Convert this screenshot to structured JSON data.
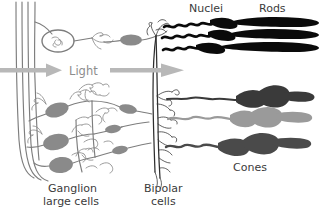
{
  "figure": {
    "title_alt": "Retina cell diagram: light path through ganglion, bipolar cells to rods and cones",
    "background_color": "#ffffff"
  },
  "labels": {
    "nuclei": "Nuclei",
    "rods": "Rods",
    "light": "Light",
    "cones": "Cones",
    "ganglion_line1": "Ganglion",
    "ganglion_line2": "large cells",
    "bipolar_line1": "Bipolar",
    "bipolar_line2": "cells"
  },
  "colors": {
    "label_text": "#3b3b3b",
    "light_text": "#8d8d8d",
    "light_arrow": "#b8b8b8",
    "ganglion_cell": "#8a8a8a",
    "ganglion_outline": "#7d7d7d",
    "bipolar_cell": "#2e2e2e",
    "rod": "#0a0a0a",
    "cone_dark": "#3a3a3a",
    "cone_light": "#9a9a9a",
    "cone_medium": "#4a4a4a"
  },
  "structures": {
    "rods": [
      {
        "name": "rod-1",
        "color": "#0a0a0a"
      },
      {
        "name": "rod-2",
        "color": "#0a0a0a"
      },
      {
        "name": "rod-3",
        "color": "#0a0a0a"
      }
    ],
    "cones": [
      {
        "name": "cone-1",
        "color": "#3a3a3a"
      },
      {
        "name": "cone-2",
        "color": "#9a9a9a"
      },
      {
        "name": "cone-3",
        "color": "#4a4a4a"
      }
    ],
    "ganglion_cells": [
      {
        "name": "ganglion-circled",
        "color": "#8a8a8a"
      },
      {
        "name": "ganglion-1",
        "color": "#8a8a8a"
      },
      {
        "name": "ganglion-2",
        "color": "#8a8a8a"
      },
      {
        "name": "ganglion-3",
        "color": "#8a8a8a"
      }
    ],
    "light_arrows": [
      {
        "name": "light-arrow-left"
      },
      {
        "name": "light-arrow-right"
      }
    ],
    "nerve_fibers": {
      "name": "optic-nerve-fibers",
      "count": 4
    }
  }
}
